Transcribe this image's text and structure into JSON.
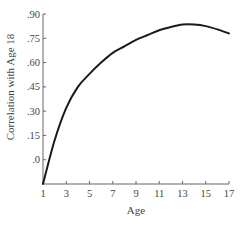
{
  "chart_data": {
    "type": "line",
    "title": "",
    "xlabel": "Age",
    "ylabel": "Correlation with Age 18",
    "xlim": [
      1,
      17
    ],
    "ylim": [
      -0.15,
      0.9
    ],
    "x_ticks": [
      1,
      3,
      5,
      7,
      9,
      11,
      13,
      15,
      17
    ],
    "x_tick_labels": [
      "1",
      "3",
      "5",
      "7",
      "9",
      "11",
      "13",
      "15",
      "17"
    ],
    "y_ticks": [
      0.0,
      0.15,
      0.3,
      0.45,
      0.6,
      0.75,
      0.9
    ],
    "y_tick_labels": [
      ".0",
      ".15",
      ".30",
      ".45",
      ".60",
      ".75",
      ".90"
    ],
    "grid": false,
    "legend": "none",
    "series": [
      {
        "name": "Correlation with Age 18",
        "color": "#1a1a1a",
        "x": [
          1,
          2,
          3,
          4,
          5,
          6,
          7,
          8,
          9,
          10,
          11,
          12,
          13,
          14,
          15,
          16,
          17
        ],
        "y": [
          -0.15,
          0.12,
          0.32,
          0.45,
          0.53,
          0.6,
          0.66,
          0.7,
          0.74,
          0.77,
          0.8,
          0.82,
          0.835,
          0.835,
          0.825,
          0.805,
          0.78
        ]
      }
    ]
  }
}
